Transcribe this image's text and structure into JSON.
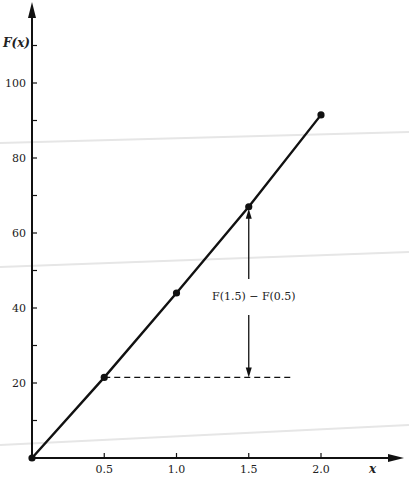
{
  "chart_data": {
    "type": "line",
    "title": "",
    "xlabel": "x",
    "ylabel": "F(x)",
    "x": [
      0,
      0.5,
      1.0,
      1.5,
      2.0
    ],
    "series": [
      {
        "name": "F(x)",
        "values": [
          0,
          21.5,
          44,
          67,
          91.5
        ],
        "markers": true
      }
    ],
    "x_ticks": [
      0.5,
      1.0,
      1.5,
      2.0
    ],
    "x_tick_labels": [
      "0.5",
      "1.0",
      "1.5",
      "2.0"
    ],
    "y_ticks_major": [
      20,
      40,
      60,
      80,
      100
    ],
    "y_tick_labels": [
      "20",
      "40",
      "60",
      "80",
      "100"
    ],
    "y_ticks_minor": [
      10,
      30,
      50,
      70,
      90,
      110
    ],
    "xlim": [
      0,
      2.45
    ],
    "ylim": [
      0,
      122
    ],
    "grid": false,
    "annotations": [
      {
        "text": "F(1.5) − F(0.5)",
        "type": "double-arrow",
        "x": 1.5,
        "y_from": 21.5,
        "y_to": 67
      },
      {
        "type": "dashed-line",
        "from": [
          0.5,
          21.5
        ],
        "to": [
          1.8,
          21.5
        ]
      }
    ]
  },
  "labels": {
    "y_axis": "F(x)",
    "x_axis": "x",
    "annotation": "F(1.5) − F(0.5)"
  }
}
